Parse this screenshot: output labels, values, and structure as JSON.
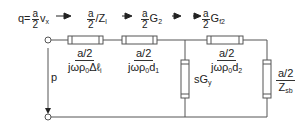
{
  "diagram": {
    "type": "equivalent-circuit",
    "colors": {
      "line": "#555555",
      "resistor_fill": "#ffffff",
      "text": "#222222"
    },
    "flow_labels": [
      {
        "id": "q",
        "prefix": "q=",
        "frac_num": "a",
        "frac_den": "2",
        "suffix": "v",
        "suffix_sub": "x"
      },
      {
        "id": "z1",
        "frac_num": "a",
        "frac_den": "2",
        "suffix": "/Z",
        "suffix_sub": "l"
      },
      {
        "id": "g2",
        "frac_num": "a",
        "frac_den": "2",
        "suffix": "G",
        "suffix_sub": "2"
      },
      {
        "id": "gf2",
        "frac_num": "a",
        "frac_den": "2",
        "suffix": "G",
        "suffix_sub": "f2"
      }
    ],
    "series_elements": [
      {
        "id": "r1",
        "num": "a/2",
        "den_main": "jωρ",
        "den_sub": "0",
        "den_tail": "Δℓ",
        "den_tail_sub": "i"
      },
      {
        "id": "r2",
        "num": "a/2",
        "den_main": "jωρ",
        "den_sub": "0",
        "den_tail": "d",
        "den_tail_sub": "1"
      },
      {
        "id": "r3",
        "num": "a/2",
        "den_main": "jωρ",
        "den_sub": "0",
        "den_tail": "d",
        "den_tail_sub": "2"
      }
    ],
    "shunt_elements": [
      {
        "id": "sgy",
        "label": "sG",
        "label_sub": "y"
      },
      {
        "id": "zsb",
        "num": "a/2",
        "den": "Z",
        "den_sub": "sb"
      }
    ],
    "port_label": "p"
  }
}
